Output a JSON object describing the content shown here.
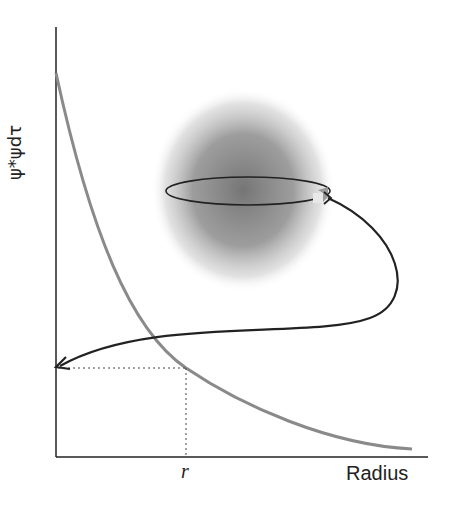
{
  "diagram": {
    "y_axis_label": "ψ*ψdτ",
    "x_axis_label": "Radius",
    "marker_label": "r",
    "colors": {
      "axes": "#222222",
      "curve": "#8a8a8a",
      "cloud": "#6e6e6e",
      "orbit": "#222222"
    },
    "elements": [
      "electron-cloud",
      "orbit-ellipse",
      "electron-cube",
      "arrow-to-axis",
      "dotted-guide-lines",
      "decay-curve"
    ]
  }
}
